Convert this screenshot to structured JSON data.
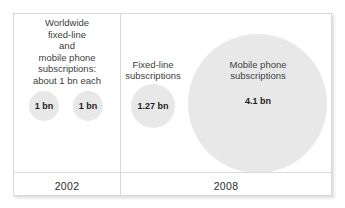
{
  "chart_data": {
    "type": "bubble",
    "title": "Worldwide fixed-line and mobile phone subscriptions",
    "unit": "bn",
    "panels": [
      {
        "year": "2002",
        "caption_lines": [
          "Worldwide",
          "fixed-line",
          "and",
          "mobile phone",
          "subscriptions:",
          "about 1 bn each"
        ],
        "bubbles": [
          {
            "series": "Fixed-line subscriptions",
            "value": 1,
            "value_label": "1 bn",
            "label": ""
          },
          {
            "series": "Mobile phone subscriptions",
            "value": 1,
            "value_label": "1 bn",
            "label": ""
          }
        ]
      },
      {
        "year": "2008",
        "caption_lines": [],
        "bubbles": [
          {
            "series": "Fixed-line subscriptions",
            "value": 1.27,
            "value_label": "1.27 bn",
            "label_lines": [
              "Fixed-line",
              "subscriptions"
            ]
          },
          {
            "series": "Mobile phone subscriptions",
            "value": 4.1,
            "value_label": "4.1 bn",
            "label_lines": [
              "Mobile phone",
              "subscriptions"
            ]
          }
        ]
      }
    ],
    "legend": "none",
    "grid": false,
    "colors": {
      "bubble_fill": "#e8e8e8",
      "text": "#404040",
      "value_text": "#1e1e1e",
      "border": "#d8d8d8",
      "background": "#ffffff"
    }
  },
  "panel_2002": {
    "caption": {
      "line1": "Worldwide",
      "line2": "fixed-line",
      "line3": "and",
      "line4": "mobile phone",
      "line5": "subscriptions:",
      "line6": "about 1 bn each"
    },
    "bubble_fixed_value": "1 bn",
    "bubble_mobile_value": "1 bn",
    "year": "2002"
  },
  "panel_2008": {
    "fixed": {
      "label_line1": "Fixed-line",
      "label_line2": "subscriptions",
      "value": "1.27 bn"
    },
    "mobile": {
      "label_line1": "Mobile phone",
      "label_line2": "subscriptions",
      "value": "4.1 bn"
    },
    "year": "2008"
  }
}
